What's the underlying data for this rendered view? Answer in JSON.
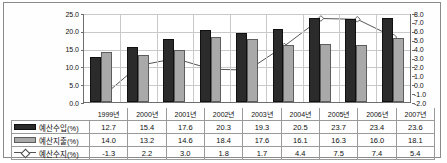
{
  "chart_data": {
    "type": "bar",
    "title": "",
    "xlabel": "",
    "ylabel": "",
    "categories": [
      "1999년",
      "2000년",
      "2001년",
      "2002년",
      "2003년",
      "2004년",
      "2005년",
      "2006년",
      "2007년"
    ],
    "series": [
      {
        "name": "예산수입(%)",
        "type": "bar",
        "axis": "left",
        "color": "#2b2b2b",
        "values": [
          12.7,
          15.4,
          17.6,
          20.3,
          19.3,
          20.5,
          23.7,
          23.4,
          23.6
        ]
      },
      {
        "name": "예산지출(%)",
        "type": "bar",
        "axis": "left",
        "color": "#a9a9a9",
        "values": [
          14.0,
          13.2,
          14.6,
          18.4,
          17.6,
          16.1,
          16.3,
          16.0,
          18.1
        ]
      },
      {
        "name": "예산수지(%)",
        "type": "line",
        "axis": "right",
        "color": "#555555",
        "values": [
          -1.3,
          2.2,
          3.0,
          1.8,
          1.7,
          4.4,
          7.5,
          7.4,
          5.4
        ]
      }
    ],
    "ylim": [
      0.0,
      25.0
    ],
    "yticks": [
      "25.0",
      "20.0",
      "15.0",
      "10.0",
      "5.0",
      "0.0"
    ],
    "y2lim": [
      -2.0,
      8.0
    ],
    "y2ticks": [
      "8.0",
      "7.0",
      "6.0",
      "5.0",
      "4.0",
      "3.0",
      "2.0",
      "1.0",
      "0.0",
      "-1.0",
      "-2.0"
    ],
    "grid": true,
    "legend_position": "bottom-table"
  },
  "table": {
    "row_labels": [
      "예산수입(%)",
      "예산지출(%)",
      "예산수지(%)"
    ],
    "years": [
      "1999년",
      "2000년",
      "2001년",
      "2002년",
      "2003년",
      "2004년",
      "2005년",
      "2006년",
      "2007년"
    ],
    "rows": [
      [
        "12.7",
        "15.4",
        "17.6",
        "20.3",
        "19.3",
        "20.5",
        "23.7",
        "23.4",
        "23.6"
      ],
      [
        "14.0",
        "13.2",
        "14.6",
        "18.4",
        "17.6",
        "16.1",
        "16.3",
        "16.0",
        "18.1"
      ],
      [
        "-1.3",
        "2.2",
        "3.0",
        "1.8",
        "1.7",
        "4.4",
        "7.5",
        "7.4",
        "5.4"
      ]
    ]
  }
}
